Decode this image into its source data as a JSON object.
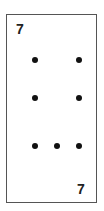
{
  "card": {
    "rank_top": "7",
    "rank_bottom": "7",
    "pip_count": 7,
    "pips": [
      {
        "x": 25,
        "y": 42
      },
      {
        "x": 69,
        "y": 42
      },
      {
        "x": 25,
        "y": 80
      },
      {
        "x": 69,
        "y": 80
      },
      {
        "x": 25,
        "y": 128
      },
      {
        "x": 47,
        "y": 128
      },
      {
        "x": 69,
        "y": 128
      }
    ]
  }
}
